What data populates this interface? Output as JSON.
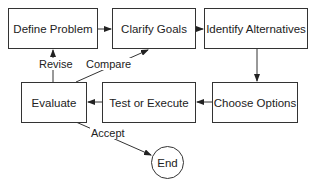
{
  "diagram": {
    "type": "flowchart",
    "nodes": {
      "define_problem": "Define Problem",
      "clarify_goals": "Clarify Goals",
      "identify_alternatives": "Identify Alternatives",
      "choose_options": "Choose Options",
      "test_or_execute": "Test or Execute",
      "evaluate": "Evaluate",
      "end": "End"
    },
    "edge_labels": {
      "revise": "Revise",
      "compare": "Compare",
      "accept": "Accept"
    },
    "edges": [
      {
        "from": "Define Problem",
        "to": "Clarify Goals"
      },
      {
        "from": "Clarify Goals",
        "to": "Identify Alternatives"
      },
      {
        "from": "Identify Alternatives",
        "to": "Choose Options"
      },
      {
        "from": "Choose Options",
        "to": "Test or Execute"
      },
      {
        "from": "Test or Execute",
        "to": "Evaluate"
      },
      {
        "from": "Evaluate",
        "to": "Define Problem",
        "label": "Revise"
      },
      {
        "from": "Evaluate",
        "to": "Clarify Goals",
        "label": "Compare"
      },
      {
        "from": "Evaluate",
        "to": "End",
        "label": "Accept"
      }
    ]
  }
}
